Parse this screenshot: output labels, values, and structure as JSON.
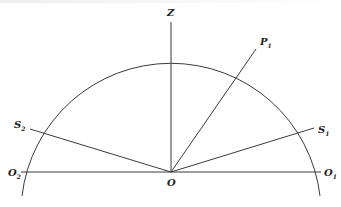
{
  "diagram": {
    "type": "semicircle-geometry",
    "center": {
      "name": "O",
      "x": 171,
      "y": 172
    },
    "radius": 150,
    "points": {
      "Z": {
        "label": "Z",
        "sub": "",
        "x": 171,
        "y": 22
      },
      "P1": {
        "label": "P",
        "sub": "1",
        "x": 256,
        "y": 49
      },
      "S1": {
        "label": "S",
        "sub": "1",
        "x": 314,
        "y": 128
      },
      "S2": {
        "label": "S",
        "sub": "2",
        "x": 30,
        "y": 129
      },
      "O1": {
        "label": "O",
        "sub": "1",
        "x": 321,
        "y": 172
      },
      "O2": {
        "label": "O",
        "sub": "2",
        "x": 21,
        "y": 172
      },
      "O": {
        "label": "O",
        "sub": "",
        "x": 171,
        "y": 172
      }
    },
    "segments": [
      "O-Z",
      "O-P1",
      "O-S1",
      "O-S2",
      "O1-O2"
    ],
    "stroke_color": "#3a3a3a"
  }
}
